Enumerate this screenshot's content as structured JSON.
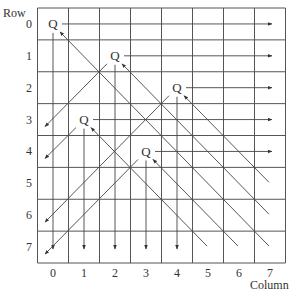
{
  "labels": {
    "row_axis": "Row",
    "column_axis": "Column",
    "rows": [
      "0",
      "1",
      "2",
      "3",
      "4",
      "5",
      "6",
      "7"
    ],
    "columns": [
      "0",
      "1",
      "2",
      "3",
      "4",
      "5",
      "6",
      "7"
    ],
    "queen_symbol": "Q"
  },
  "board": {
    "size": 8,
    "queens": [
      {
        "row": 0,
        "col": 0
      },
      {
        "row": 1,
        "col": 2
      },
      {
        "row": 2,
        "col": 4
      },
      {
        "row": 3,
        "col": 1
      },
      {
        "row": 4,
        "col": 3
      }
    ]
  },
  "colors": {
    "grid": "#555555",
    "arrow": "#444444",
    "text": "#333333",
    "background": "#ffffff"
  }
}
